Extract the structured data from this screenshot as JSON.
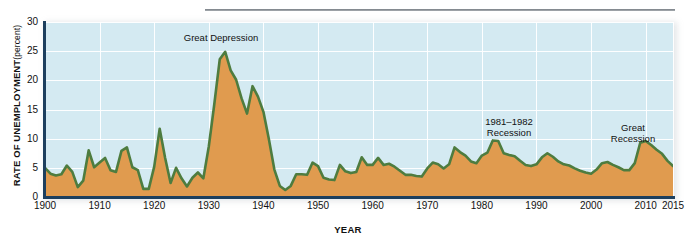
{
  "chart_data": {
    "type": "area",
    "title": "",
    "xlabel": "YEAR",
    "ylabel": "RATE OF UNEMPLOYMENT",
    "ylabel_unit": "(percent)",
    "xlim": [
      1900,
      2015
    ],
    "ylim": [
      0,
      30
    ],
    "ytick_labels": [
      "0",
      "5",
      "10",
      "15",
      "20",
      "25",
      "30"
    ],
    "ytick_values": [
      0,
      5,
      10,
      15,
      20,
      25,
      30
    ],
    "xtick_labels": [
      "1900",
      "1910",
      "1920",
      "1930",
      "1940",
      "1950",
      "1960",
      "1970",
      "1980",
      "1990",
      "2000",
      "2010",
      "2015"
    ],
    "xtick_values": [
      1900,
      1910,
      1920,
      1930,
      1940,
      1950,
      1960,
      1970,
      1980,
      1990,
      2000,
      2010,
      2015
    ],
    "grid": true,
    "legend": "none",
    "series_name": "Rate of unemployment",
    "x": [
      1900,
      1901,
      1902,
      1903,
      1904,
      1905,
      1906,
      1907,
      1908,
      1909,
      1910,
      1911,
      1912,
      1913,
      1914,
      1915,
      1916,
      1917,
      1918,
      1919,
      1920,
      1921,
      1922,
      1923,
      1924,
      1925,
      1926,
      1927,
      1928,
      1929,
      1930,
      1931,
      1932,
      1933,
      1934,
      1935,
      1936,
      1937,
      1938,
      1939,
      1940,
      1941,
      1942,
      1943,
      1944,
      1945,
      1946,
      1947,
      1948,
      1949,
      1950,
      1951,
      1952,
      1953,
      1954,
      1955,
      1956,
      1957,
      1958,
      1959,
      1960,
      1961,
      1962,
      1963,
      1964,
      1965,
      1966,
      1967,
      1968,
      1969,
      1970,
      1971,
      1972,
      1973,
      1974,
      1975,
      1976,
      1977,
      1978,
      1979,
      1980,
      1981,
      1982,
      1983,
      1984,
      1985,
      1986,
      1987,
      1988,
      1989,
      1990,
      1991,
      1992,
      1993,
      1994,
      1995,
      1996,
      1997,
      1998,
      1999,
      2000,
      2001,
      2002,
      2003,
      2004,
      2005,
      2006,
      2007,
      2008,
      2009,
      2010,
      2011,
      2012,
      2013,
      2014,
      2015
    ],
    "values": [
      5.0,
      4.0,
      3.7,
      3.9,
      5.4,
      4.3,
      1.7,
      2.8,
      8.0,
      5.1,
      5.9,
      6.7,
      4.6,
      4.3,
      7.9,
      8.5,
      5.1,
      4.6,
      1.4,
      1.4,
      5.2,
      11.7,
      6.7,
      2.4,
      5.0,
      3.2,
      1.8,
      3.3,
      4.2,
      3.2,
      8.7,
      15.9,
      23.6,
      24.9,
      21.7,
      20.1,
      16.9,
      14.3,
      19.0,
      17.2,
      14.6,
      9.9,
      4.7,
      1.9,
      1.2,
      1.9,
      3.9,
      3.9,
      3.8,
      5.9,
      5.3,
      3.3,
      3.0,
      2.9,
      5.5,
      4.4,
      4.1,
      4.3,
      6.8,
      5.5,
      5.5,
      6.7,
      5.5,
      5.7,
      5.2,
      4.5,
      3.8,
      3.8,
      3.6,
      3.5,
      4.9,
      5.9,
      5.6,
      4.9,
      5.6,
      8.5,
      7.7,
      7.1,
      6.1,
      5.8,
      7.1,
      7.6,
      9.7,
      9.6,
      7.5,
      7.2,
      7.0,
      6.2,
      5.5,
      5.3,
      5.6,
      6.8,
      7.5,
      6.9,
      6.1,
      5.6,
      5.4,
      4.9,
      4.5,
      4.2,
      4.0,
      4.7,
      5.8,
      6.0,
      5.5,
      5.1,
      4.6,
      4.6,
      5.8,
      9.3,
      9.6,
      8.9,
      8.1,
      7.4,
      6.2,
      5.3
    ]
  },
  "annotations": [
    {
      "id": "great-depression",
      "text": "Great Depression"
    },
    {
      "id": "recession-1981-1982",
      "text": "1981–1982\nRecession"
    },
    {
      "id": "great-recession",
      "text": "Great\nRecession"
    }
  ],
  "colors": {
    "plot_background": "#d4eaf2",
    "gridline": "#ffffff",
    "area_fill": "#e09b4f",
    "series_line": "#4e7c3f",
    "axis_line": "#1d3f5e",
    "text": "#111111",
    "page_background": "#ffffff",
    "top_rule": "#6f757b"
  }
}
